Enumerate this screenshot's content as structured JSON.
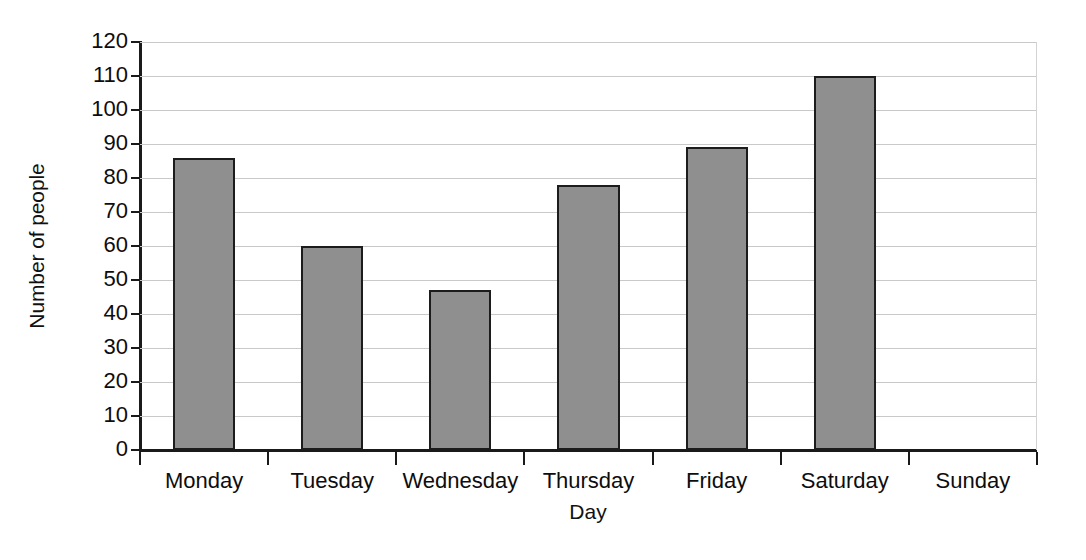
{
  "chart_data": {
    "type": "bar",
    "title": "",
    "xlabel": "Day",
    "ylabel": "Number of people",
    "categories": [
      "Monday",
      "Tuesday",
      "Wednesday",
      "Thursday",
      "Friday",
      "Saturday",
      "Sunday"
    ],
    "values": [
      86,
      60,
      47,
      78,
      89,
      110,
      0
    ],
    "ylim": [
      0,
      120
    ],
    "ytick_step": 10,
    "yticks": [
      0,
      10,
      20,
      30,
      40,
      50,
      60,
      70,
      80,
      90,
      100,
      110,
      120
    ],
    "ytick_labels": [
      "0",
      "10",
      "20",
      "30",
      "40",
      "50",
      "60",
      "70",
      "80",
      "90",
      "100",
      "110",
      "120"
    ],
    "grid": true,
    "grid_axis": "y",
    "legend": false,
    "legend_position": "none",
    "bar_fill_color": "#8f8f8f",
    "bar_edge_color": "#1c1c1c",
    "gridline_color": "#c9c9c9",
    "axis_color": "#1a1a1a",
    "background_color": "#ffffff"
  }
}
